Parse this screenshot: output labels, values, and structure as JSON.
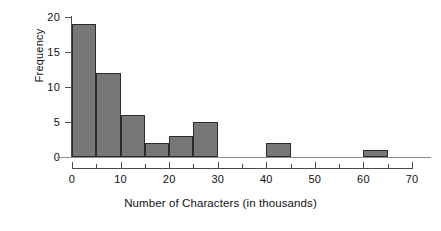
{
  "chart_data": {
    "type": "bar",
    "title": "",
    "subtitle": "",
    "xlabel": "Number of Characters (in thousands)",
    "ylabel": "Frequency",
    "bin_width": 5,
    "bins": [
      {
        "label": "0-5",
        "x0": 0,
        "x1": 5,
        "value": 19
      },
      {
        "label": "5-10",
        "x0": 5,
        "x1": 10,
        "value": 12
      },
      {
        "label": "10-15",
        "x0": 10,
        "x1": 15,
        "value": 6
      },
      {
        "label": "15-20",
        "x0": 15,
        "x1": 20,
        "value": 2
      },
      {
        "label": "20-25",
        "x0": 20,
        "x1": 25,
        "value": 3
      },
      {
        "label": "25-30",
        "x0": 25,
        "x1": 30,
        "value": 5
      },
      {
        "label": "30-35",
        "x0": 30,
        "x1": 35,
        "value": 0
      },
      {
        "label": "35-40",
        "x0": 35,
        "x1": 40,
        "value": 0
      },
      {
        "label": "40-45",
        "x0": 40,
        "x1": 45,
        "value": 2
      },
      {
        "label": "45-50",
        "x0": 45,
        "x1": 50,
        "value": 0
      },
      {
        "label": "50-55",
        "x0": 50,
        "x1": 55,
        "value": 0
      },
      {
        "label": "55-60",
        "x0": 55,
        "x1": 60,
        "value": 0
      },
      {
        "label": "60-65",
        "x0": 60,
        "x1": 65,
        "value": 1
      },
      {
        "label": "65-70",
        "x0": 65,
        "x1": 70,
        "value": 0
      }
    ],
    "categories": [
      "0-5",
      "5-10",
      "10-15",
      "15-20",
      "20-25",
      "25-30",
      "30-35",
      "35-40",
      "40-45",
      "45-50",
      "50-55",
      "55-60",
      "60-65",
      "65-70"
    ],
    "values": [
      19,
      12,
      6,
      2,
      3,
      5,
      0,
      0,
      2,
      0,
      0,
      0,
      1,
      0
    ],
    "xlim": [
      0,
      70
    ],
    "ylim": [
      0,
      20
    ],
    "x_ticks": [
      0,
      10,
      20,
      30,
      40,
      50,
      60,
      70
    ],
    "x_tick_labels": [
      "0",
      "10",
      "20",
      "30",
      "40",
      "50",
      "60",
      "70"
    ],
    "x_minor_ticks": [
      5,
      15,
      25,
      35,
      45,
      55,
      65
    ],
    "y_ticks": [
      0,
      5,
      10,
      15,
      20
    ],
    "y_tick_labels": [
      "0",
      "5",
      "10",
      "15",
      "20"
    ],
    "grid": false,
    "legend": false,
    "legend_position": "none",
    "colors": {
      "bar_fill": "#777777",
      "bar_edge": "#2b2b2b",
      "axis": "#4a4a4a",
      "text": "#111111",
      "background": "#ffffff"
    }
  }
}
